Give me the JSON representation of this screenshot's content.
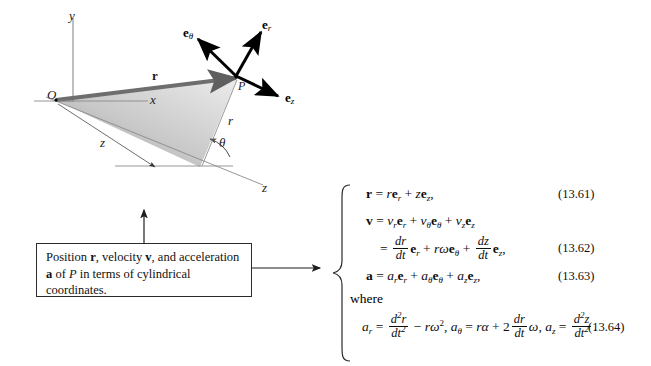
{
  "figure": {
    "type": "cylindrical-coordinates-diagram",
    "caption": {
      "line1_a": "Position ",
      "line1_r": "r",
      "line1_b": ", velocity ",
      "line1_v": "v",
      "line1_c": ", and acceleration",
      "line2_a": "a",
      "line2_b": " of ",
      "line2_P": "P",
      "line2_c": " in terms of cylindrical",
      "line3": "coordinates."
    },
    "axis_labels": {
      "y": "y",
      "x": "x",
      "z_axis": "z",
      "z_projection": "z",
      "origin": "O",
      "point": "P",
      "radial": "r",
      "angle": "θ",
      "position_vector": "r"
    },
    "unit_vectors": [
      {
        "name": "e-theta",
        "base": "e",
        "sub": "θ"
      },
      {
        "name": "e-r",
        "base": "e",
        "sub": "r"
      },
      {
        "name": "e-z",
        "base": "e",
        "sub": "z"
      }
    ],
    "colors": {
      "vector_r_fill": "#6e6e6e",
      "triangle_light": "#e9e9e9",
      "triangle_dark": "#9a9a9a",
      "axis_line": "#8a8a8a",
      "arrow_black": "#000000",
      "text": "#111111"
    }
  },
  "equations": {
    "eq1": {
      "number": "(13.61)",
      "lhs": "r",
      "text": "r = re_r + ze_z,"
    },
    "eq2": {
      "number": "(13.62)",
      "line1": "v = v_r e_r + v_θ e_θ + v_z e_z",
      "line2": "= (dr/dt) e_r + rω e_θ + (dz/dt) e_z,"
    },
    "eq3": {
      "number": "(13.63)",
      "text": "a = a_r e_r + a_θ e_θ + a_z e_z,"
    },
    "where_label": "where",
    "eq4": {
      "number": "(13.64)",
      "text": "a_r = d²r/dt² − rω², a_θ = rα + 2(dr/dt)ω, a_z = d²z/dt²."
    },
    "symbols": {
      "r": "r",
      "v": "v",
      "a": "a",
      "e": "e",
      "d": "d",
      "t": "t",
      "z": "z",
      "omega": "ω",
      "alpha": "α",
      "theta": "θ",
      "two": "2",
      "squared": "2",
      "equals": "=",
      "plus": "+",
      "minus": "−",
      "comma": ",",
      "period": ".",
      "sub_r": "r",
      "sub_theta": "θ",
      "sub_z": "z"
    }
  }
}
